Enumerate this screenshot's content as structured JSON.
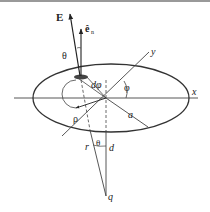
{
  "figure": {
    "labels": {
      "E": "E",
      "e_n": "ê",
      "e_n_sub": "n",
      "theta_top": "θ",
      "dphi": "dφ",
      "phi": "φ",
      "rho": "ρ",
      "a": "a",
      "x": "x",
      "y": "y",
      "r": "r",
      "theta_bottom": "θ",
      "d": "d",
      "q": "q"
    },
    "colors": {
      "line": "#333333",
      "border": "#888888",
      "patch": "#444444"
    }
  }
}
